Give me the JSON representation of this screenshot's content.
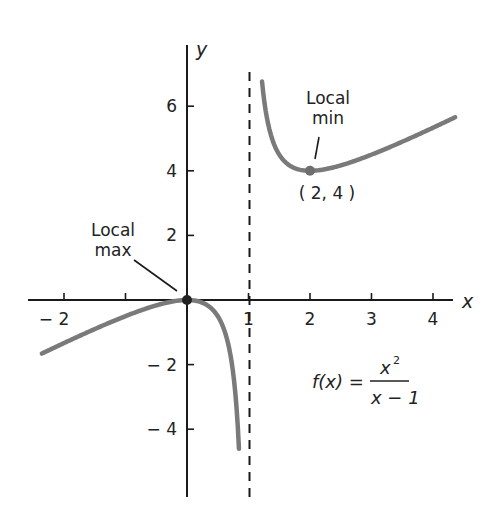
{
  "chart_data": {
    "type": "line",
    "title": "",
    "function": "f(x) = x^2 / (x - 1)",
    "xlabel": "x",
    "ylabel": "y",
    "xlim": [
      -2.6,
      4.4
    ],
    "ylim": [
      -6.2,
      7.8
    ],
    "x_ticks": [
      -2,
      -1,
      1,
      2,
      3,
      4
    ],
    "x_tick_labels": [
      "− 2",
      "",
      "1",
      "2",
      "3",
      "4"
    ],
    "y_ticks": [
      6,
      4,
      2,
      -2,
      -4
    ],
    "y_tick_labels": [
      "6",
      "4",
      "2",
      "− 2",
      "− 4"
    ],
    "vertical_asymptote": {
      "x": 1,
      "style": "dashed"
    },
    "series": [
      {
        "name": "f(x) left branch",
        "x_range": [
          -2.36,
          0.845
        ],
        "sample_points": [
          [
            -2,
            -1.333
          ],
          [
            -1,
            -0.5
          ],
          [
            0,
            0
          ],
          [
            0.5,
            -0.5
          ],
          [
            0.8,
            -3.2
          ]
        ]
      },
      {
        "name": "f(x) right branch",
        "x_range": [
          1.22,
          4.36
        ],
        "sample_points": [
          [
            1.25,
            6.25
          ],
          [
            1.5,
            4.5
          ],
          [
            2,
            4
          ],
          [
            3,
            4.5
          ],
          [
            4,
            5.333
          ]
        ]
      }
    ],
    "points": [
      {
        "label": "Local max",
        "x": 0,
        "y": 0
      },
      {
        "label": "Local min",
        "x": 2,
        "y": 4,
        "coord_label": "( 2, 4 )"
      }
    ],
    "annotations": {
      "local_max": {
        "line1": "Local",
        "line2": "max"
      },
      "local_min": {
        "line1": "Local",
        "line2": "min",
        "coords": "( 2, 4 )"
      },
      "formula": {
        "lhs": "f(x) =",
        "numerator": "x",
        "numerator_exp": "2",
        "denominator": "x − 1"
      }
    },
    "grid": false,
    "legend": "none",
    "colors": {
      "curve": "#7a7a7a",
      "axis": "#1a1a1a",
      "text": "#222222"
    }
  }
}
